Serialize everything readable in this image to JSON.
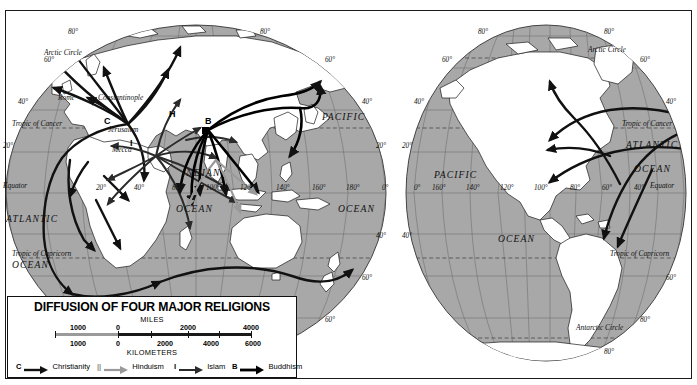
{
  "map": {
    "title": "DIFFUSION OF FOUR MAJOR RELIGIONS",
    "projection": "two-hemisphere oval world map"
  },
  "legend": {
    "title": "DIFFUSION OF FOUR MAJOR RELIGIONS",
    "scales": [
      {
        "unit": "MILES",
        "unit_position": "above",
        "ticks": [
          "1000",
          "0",
          "2000",
          "4000"
        ]
      },
      {
        "unit": "KILOMETERS",
        "unit_position": "below",
        "ticks": [
          "1000",
          "0",
          "2000",
          "4000",
          "6000"
        ]
      }
    ],
    "keys": [
      {
        "symbol": "C",
        "label": "Christianity",
        "arrow": "dark-arrow",
        "color": "#111111"
      },
      {
        "symbol": "||",
        "label": "Hinduism",
        "arrow": "light-arrow",
        "color": "#9a9a9a"
      },
      {
        "symbol": "I",
        "label": "Islam",
        "arrow": "medium-arrow",
        "color": "#2b2b2b"
      },
      {
        "symbol": "B",
        "label": "Buddhism",
        "arrow": "heavy-arrow",
        "color": "#000000"
      }
    ]
  },
  "hemispheres": {
    "left": {
      "name": "Eastern Hemisphere",
      "oceans": [
        {
          "line1": "PACIFIC",
          "line2": ""
        },
        {
          "line1": "INDIAN",
          "line2": "OCEAN"
        },
        {
          "line1": "ATLANTIC",
          "line2": "OCEAN"
        },
        {
          "line1": "OCEAN",
          "line2": ""
        }
      ],
      "latitude_labels": [
        "80°",
        "80°",
        "60°",
        "60°",
        "40°",
        "40°",
        "20°",
        "20°",
        "40°",
        "40°",
        "60°",
        "60°",
        "80°"
      ],
      "longitude_labels": [
        "20°",
        "40°",
        "80°",
        "100°",
        "120°",
        "140°",
        "160°",
        "180°",
        "0°"
      ],
      "reference_lines": [
        "Arctic Circle",
        "Tropic of Cancer",
        "Equator",
        "Tropic of Capricorn"
      ],
      "cities": [
        "Rome",
        "Constantinople",
        "Jerusalem",
        "Mecca"
      ],
      "religion_markers": [
        {
          "letter": "C",
          "place": "Jerusalem"
        },
        {
          "letter": "I",
          "place": "Mecca"
        },
        {
          "letter": "B",
          "place": "Northern India"
        },
        {
          "letter": "H",
          "place": "India"
        }
      ]
    },
    "right": {
      "name": "Western Hemisphere",
      "oceans": [
        {
          "line1": "PACIFIC",
          "line2": ""
        },
        {
          "line1": "OCEAN",
          "line2": ""
        },
        {
          "line1": "ATLANTIC",
          "line2": "OCEAN"
        }
      ],
      "latitude_labels": [
        "80°",
        "80°",
        "60°",
        "60°",
        "40°",
        "40°",
        "20°",
        "20°",
        "40°",
        "60°",
        "80°"
      ],
      "longitude_labels": [
        "160°",
        "140°",
        "120°",
        "100°",
        "80°",
        "60°",
        "40°",
        "0°"
      ],
      "reference_lines": [
        "Arctic Circle",
        "Tropic of Cancer",
        "Equator",
        "Tropic of Capricorn",
        "Antarctic Circle"
      ]
    }
  },
  "colors": {
    "ocean_fill": "#a8a8a8",
    "land_fill": "#ffffff",
    "graticule": "#6d6d6d",
    "coastline": "#1a1a1a",
    "arrow_dark": "#111111",
    "arrow_light": "#9a9a9a",
    "frame": "#1a1a1a"
  }
}
